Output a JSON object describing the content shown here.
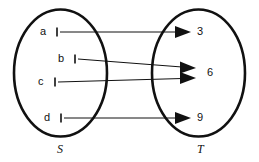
{
  "diagram": {
    "type": "function-mapping-diagram",
    "background_color": "#ffffff",
    "stroke_color": "#111111",
    "sets": [
      {
        "id": "S",
        "name": "domain-set",
        "label": "S",
        "label_x": 60,
        "label_y": 150,
        "ellipse": {
          "cx": 60.5,
          "cy": 73,
          "rx": 46.5,
          "ry": 63.5
        },
        "stroke_width": 2.6,
        "elements": [
          {
            "key": "a",
            "label": "a",
            "label_x": 44,
            "label_y": 32,
            "tick_x": 57,
            "tick_y": 32
          },
          {
            "key": "b",
            "label": "b",
            "label_x": 62,
            "label_y": 59,
            "tick_x": 75,
            "tick_y": 59
          },
          {
            "key": "c",
            "label": "c",
            "label_x": 42,
            "label_y": 82,
            "tick_x": 55,
            "tick_y": 82
          },
          {
            "key": "d",
            "label": "d",
            "label_x": 48,
            "label_y": 118,
            "tick_x": 61,
            "tick_y": 118
          }
        ]
      },
      {
        "id": "T",
        "name": "codomain-set",
        "label": "T",
        "label_x": 200,
        "label_y": 150,
        "ellipse": {
          "cx": 198.5,
          "cy": 73,
          "rx": 46.5,
          "ry": 63.5
        },
        "stroke_width": 2.6,
        "elements": [
          {
            "key": "3",
            "label": "3",
            "label_x": 200,
            "label_y": 32
          },
          {
            "key": "6",
            "label": "6",
            "label_x": 210,
            "label_y": 73
          },
          {
            "key": "9",
            "label": "9",
            "label_x": 200,
            "label_y": 118
          }
        ]
      }
    ],
    "arrows": [
      {
        "from": "a",
        "to": "3",
        "x1": 60,
        "y1": 32,
        "x2": 191,
        "y2": 32
      },
      {
        "from": "b",
        "to": "6",
        "x1": 78,
        "y1": 59,
        "x2": 196,
        "y2": 68
      },
      {
        "from": "c",
        "to": "6",
        "x1": 58,
        "y1": 82,
        "x2": 196,
        "y2": 78
      },
      {
        "from": "d",
        "to": "9",
        "x1": 64,
        "y1": 118,
        "x2": 191,
        "y2": 118
      }
    ],
    "arrow_line_width": 1.0,
    "arrowhead": {
      "length": 16,
      "half_height": 6
    },
    "tick": {
      "width": 1.6,
      "height": 9
    }
  }
}
